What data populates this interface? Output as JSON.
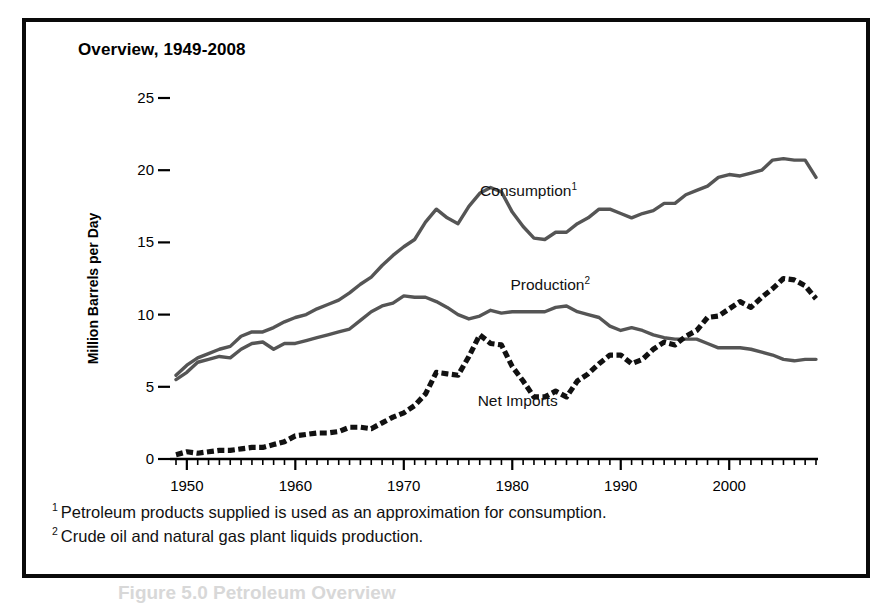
{
  "figure": {
    "title": "Overview, 1949-2008",
    "footnotes": [
      {
        "marker": "1",
        "text": "Petroleum products supplied is used as an approximation for consumption."
      },
      {
        "marker": "2",
        "text": "Crude oil and natural gas plant liquids production."
      }
    ],
    "caption_partial": "Figure 5.0  Petroleum Overview"
  },
  "chart_data": {
    "type": "line",
    "title": "Overview, 1949-2008",
    "xlabel": "",
    "ylabel": "Million Barrels per Day",
    "xlim": [
      1949,
      2008
    ],
    "ylim": [
      0,
      25
    ],
    "yticks": [
      0,
      5,
      10,
      15,
      20,
      25
    ],
    "ytick_labels": [
      "0",
      "5",
      "10",
      "15",
      "20",
      "25"
    ],
    "xticks": [
      1950,
      1960,
      1970,
      1980,
      1990,
      2000
    ],
    "xtick_labels": [
      "1950",
      "1960",
      "1970",
      "1980",
      "1990",
      "2000"
    ],
    "x_minor_tick_interval": 1,
    "grid": false,
    "legend": "inline-annotations",
    "x": [
      1949,
      1950,
      1951,
      1952,
      1953,
      1954,
      1955,
      1956,
      1957,
      1958,
      1959,
      1960,
      1961,
      1962,
      1963,
      1964,
      1965,
      1966,
      1967,
      1968,
      1969,
      1970,
      1971,
      1972,
      1973,
      1974,
      1975,
      1976,
      1977,
      1978,
      1979,
      1980,
      1981,
      1982,
      1983,
      1984,
      1985,
      1986,
      1987,
      1988,
      1989,
      1990,
      1991,
      1992,
      1993,
      1994,
      1995,
      1996,
      1997,
      1998,
      1999,
      2000,
      2001,
      2002,
      2003,
      2004,
      2005,
      2006,
      2007,
      2008
    ],
    "series": [
      {
        "name": "Consumption",
        "footnote": "1",
        "style": "solid",
        "color": "#555555",
        "label_position": {
          "x": 1981.5,
          "y": 18.2
        },
        "values": [
          5.8,
          6.5,
          7.0,
          7.3,
          7.6,
          7.8,
          8.5,
          8.8,
          8.8,
          9.1,
          9.5,
          9.8,
          10.0,
          10.4,
          10.7,
          11.0,
          11.5,
          12.1,
          12.6,
          13.4,
          14.1,
          14.7,
          15.2,
          16.4,
          17.3,
          16.7,
          16.3,
          17.5,
          18.4,
          18.8,
          18.5,
          17.1,
          16.1,
          15.3,
          15.2,
          15.7,
          15.7,
          16.3,
          16.7,
          17.3,
          17.3,
          17.0,
          16.7,
          17.0,
          17.2,
          17.7,
          17.7,
          18.3,
          18.6,
          18.9,
          19.5,
          19.7,
          19.6,
          19.8,
          20.0,
          20.7,
          20.8,
          20.7,
          20.7,
          19.5
        ]
      },
      {
        "name": "Production",
        "footnote": "2",
        "style": "solid",
        "color": "#555555",
        "label_position": {
          "x": 1983.5,
          "y": 11.7
        },
        "values": [
          5.5,
          6.0,
          6.7,
          6.9,
          7.1,
          7.0,
          7.6,
          8.0,
          8.1,
          7.6,
          8.0,
          8.0,
          8.2,
          8.4,
          8.6,
          8.8,
          9.0,
          9.6,
          10.2,
          10.6,
          10.8,
          11.3,
          11.2,
          11.2,
          10.9,
          10.5,
          10.0,
          9.7,
          9.9,
          10.3,
          10.1,
          10.2,
          10.2,
          10.2,
          10.2,
          10.5,
          10.6,
          10.2,
          10.0,
          9.8,
          9.2,
          8.9,
          9.1,
          8.9,
          8.6,
          8.4,
          8.3,
          8.3,
          8.3,
          8.0,
          7.7,
          7.7,
          7.7,
          7.6,
          7.4,
          7.2,
          6.9,
          6.8,
          6.9,
          6.9
        ]
      },
      {
        "name": "Net Imports",
        "footnote": "",
        "style": "dashed",
        "color": "#111111",
        "label_position": {
          "x": 1980.5,
          "y": 3.7
        },
        "values": [
          0.3,
          0.5,
          0.4,
          0.5,
          0.6,
          0.6,
          0.7,
          0.8,
          0.8,
          1.0,
          1.2,
          1.6,
          1.7,
          1.8,
          1.8,
          1.9,
          2.2,
          2.2,
          2.1,
          2.5,
          2.9,
          3.2,
          3.7,
          4.5,
          6.0,
          5.9,
          5.8,
          7.1,
          8.6,
          8.0,
          7.9,
          6.4,
          5.4,
          4.3,
          4.3,
          4.7,
          4.3,
          5.4,
          5.9,
          6.6,
          7.2,
          7.2,
          6.6,
          6.9,
          7.6,
          8.1,
          7.9,
          8.5,
          8.9,
          9.8,
          9.9,
          10.4,
          10.9,
          10.5,
          11.2,
          11.8,
          12.5,
          12.4,
          12.0,
          11.1
        ]
      }
    ]
  }
}
